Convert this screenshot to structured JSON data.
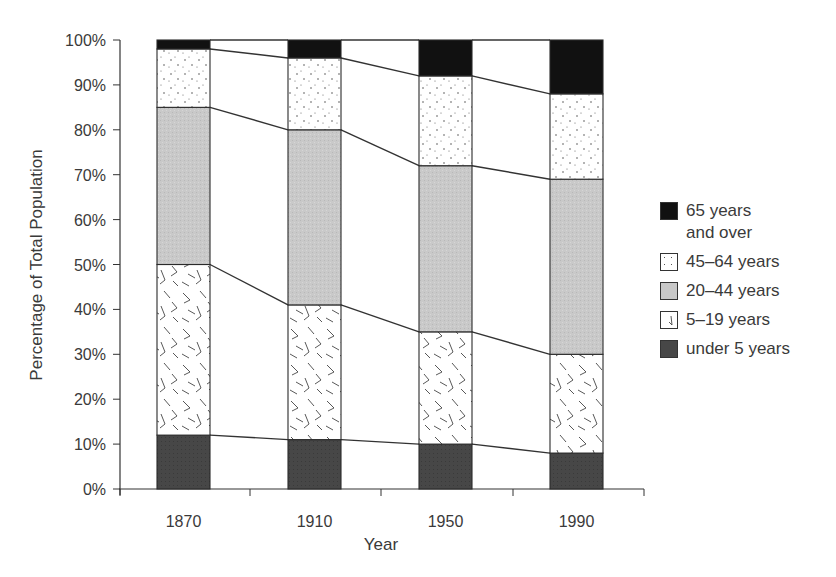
{
  "chart_data": {
    "type": "bar",
    "stacked": true,
    "title": "",
    "xlabel": "Year",
    "ylabel": "Percentage of Total Population",
    "ylim": [
      0,
      100
    ],
    "yticks": [
      "0%",
      "10%",
      "20%",
      "30%",
      "40%",
      "50%",
      "60%",
      "70%",
      "80%",
      "90%",
      "100%"
    ],
    "categories": [
      "1870",
      "1910",
      "1950",
      "1990"
    ],
    "series": [
      {
        "name": "under 5 years",
        "values": [
          12,
          11,
          10,
          8
        ],
        "pattern": "solid-dark",
        "color": "#4a4a4a"
      },
      {
        "name": "5–19 years",
        "values": [
          38,
          30,
          25,
          22
        ],
        "pattern": "random-strokes",
        "color": "#ffffff"
      },
      {
        "name": "20–44 years",
        "values": [
          35,
          39,
          37,
          39
        ],
        "pattern": "light-gray",
        "color": "#c8c8c8"
      },
      {
        "name": "45–64 years",
        "values": [
          13,
          16,
          20,
          19
        ],
        "pattern": "dots",
        "color": "#ffffff"
      },
      {
        "name": "65 years and over",
        "values": [
          2,
          4,
          8,
          12
        ],
        "pattern": "solid-black",
        "color": "#111111"
      }
    ],
    "connector_lines": true,
    "grid": false,
    "legend_position": "right"
  },
  "legend": {
    "items": [
      {
        "label_line1": "65 years",
        "label_line2": "and over",
        "key": "65plus"
      },
      {
        "label_line1": "45–64 years",
        "label_line2": "",
        "key": "45to64"
      },
      {
        "label_line1": "20–44 years",
        "label_line2": "",
        "key": "20to44"
      },
      {
        "label_line1": "5–19 years",
        "label_line2": "",
        "key": "5to19"
      },
      {
        "label_line1": "under 5 years",
        "label_line2": "",
        "key": "under5"
      }
    ]
  }
}
